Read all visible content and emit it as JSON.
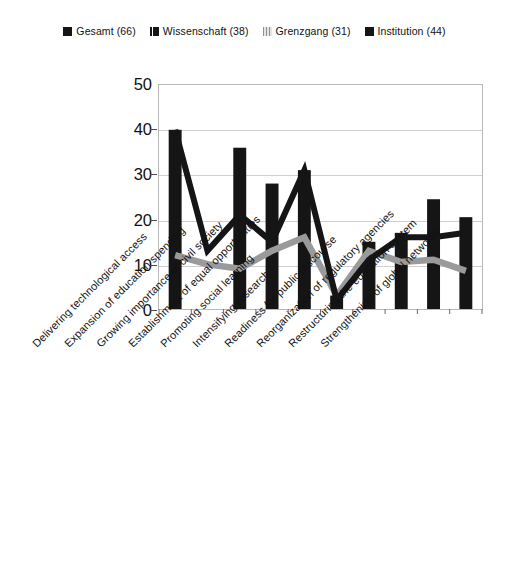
{
  "legend": {
    "position": "top-center",
    "items": [
      {
        "label": "Gesamt (66)",
        "swatch": "solid-black-square",
        "color": "#151515",
        "style": "sw-solid"
      },
      {
        "label": "Wissenschaft (38)",
        "swatch": "split-black-square",
        "color": "#151515",
        "style": "sw-dark"
      },
      {
        "label": "Grenzgang (31)",
        "swatch": "gray-hatched-square",
        "color": "#9a9a9a",
        "style": "sw-gray"
      },
      {
        "label": "Institution (44)",
        "swatch": "solid-black-square",
        "color": "#151515",
        "style": "sw-solid"
      }
    ]
  },
  "axis": {
    "y_ticks": [
      "0",
      "10",
      "20",
      "30",
      "40",
      "50"
    ]
  },
  "chart_data": {
    "type": "bar",
    "title": "",
    "subtitle": "",
    "xlabel": "",
    "ylabel": "",
    "ylim": [
      0,
      50
    ],
    "ytick_values": [
      0,
      10,
      20,
      30,
      40,
      50
    ],
    "grid": true,
    "legend_position": "top-center",
    "categories": [
      "Delivering technological access",
      "Expansion of education spending",
      "Growing importance of civil society",
      "Establishment of equal opportunities",
      "Promoting social learning",
      "Intensifying research",
      "Readiness for public discourse",
      "Reorganization of regulatory agencies",
      "Restructuring the education system",
      "Strengthening of global networks"
    ],
    "series": [
      {
        "name": "Gesamt (66)",
        "render": "bar",
        "color": "#151515",
        "values": [
          40,
          0,
          36,
          28,
          31,
          3,
          15,
          17,
          24.5,
          20.5
        ]
      },
      {
        "name": "Wissenschaft (38)",
        "render": "line",
        "color": "#151515",
        "values": [
          40,
          13,
          21,
          15,
          31,
          2,
          11,
          16,
          16,
          17
        ]
      },
      {
        "name": "Grenzgang (31)",
        "render": "line",
        "color": "#9a9a9a",
        "values": [
          12,
          10,
          9,
          13,
          16,
          3,
          13,
          10.5,
          11,
          8.5
        ]
      },
      {
        "name": "Institution (44)",
        "render": "line",
        "color": "#151515",
        "values": [
          40,
          13,
          21,
          15,
          31,
          2,
          11,
          16,
          16,
          17
        ]
      }
    ]
  }
}
